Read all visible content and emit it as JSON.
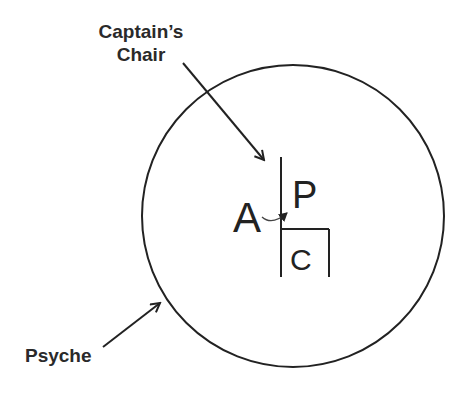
{
  "diagram": {
    "labels": {
      "captains_chair_line1": "Captain’s",
      "captains_chair_line2": "Chair",
      "psyche": "Psyche",
      "a": "A",
      "p": "P",
      "c": "C"
    },
    "colors": {
      "stroke": "#222222",
      "text": "#2a2a2a",
      "background": "#ffffff"
    }
  }
}
